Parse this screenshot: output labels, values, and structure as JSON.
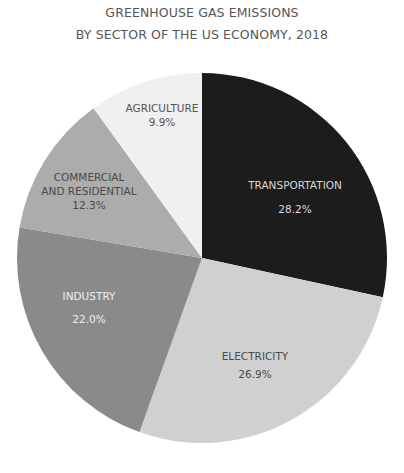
{
  "chart_data": {
    "type": "pie",
    "title": "GREENHOUSE GAS EMISSIONS",
    "subtitle": "BY SECTOR OF THE US ECONOMY, 2018",
    "start": "top",
    "direction": "clockwise",
    "slices": [
      {
        "label": "TRANSPORTATION",
        "value": 28.2,
        "display": "28.2%",
        "color": "#1c1c1c",
        "text_color": "#d8d8d8",
        "lines": [
          "TRANSPORTATION"
        ]
      },
      {
        "label": "ELECTRICITY",
        "value": 26.9,
        "display": "26.9%",
        "color": "#d0d0d0",
        "text_color": "#4a4a4a",
        "lines": [
          "ELECTRICITY"
        ]
      },
      {
        "label": "INDUSTRY",
        "value": 22.0,
        "display": "22.0%",
        "color": "#8a8a8a",
        "text_color": "#eeeeee",
        "lines": [
          "INDUSTRY"
        ]
      },
      {
        "label": "COMMERCIAL AND RESIDENTIAL",
        "value": 12.3,
        "display": "12.3%",
        "color": "#acacac",
        "text_color": "#4a4a4a",
        "lines": [
          "COMMERCIAL",
          "AND RESIDENTIAL"
        ]
      },
      {
        "label": "AGRICULTURE",
        "value": 9.9,
        "display": "9.9%",
        "color": "#f0f0f0",
        "text_color": "#555555",
        "lines": [
          "AGRICULTURE"
        ]
      }
    ]
  }
}
